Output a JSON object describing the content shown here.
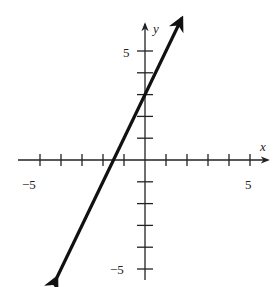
{
  "chart_data": {
    "type": "line",
    "title": "",
    "xlabel": "x",
    "ylabel": "y",
    "xlim": [
      -5.5,
      5.7
    ],
    "ylim": [
      -5.4,
      6.5
    ],
    "x_ticks": [
      -5,
      -4,
      -3,
      -2,
      -1,
      1,
      2,
      3,
      4,
      5
    ],
    "y_ticks": [
      -5,
      -4,
      -3,
      -2,
      -1,
      1,
      2,
      3,
      4,
      5
    ],
    "x_tick_labels": [
      {
        "value": -5,
        "label": "−5"
      },
      {
        "value": 5,
        "label": "5"
      }
    ],
    "y_tick_labels": [
      {
        "value": 5,
        "label": "5"
      },
      {
        "value": -5,
        "label": "−5"
      }
    ],
    "grid": false,
    "series": [
      {
        "name": "y = 2x + 3",
        "equation": "y = 2x + 3",
        "slope": 2,
        "y_intercept": 3,
        "x_intercept": -1.5,
        "x": [
          -4.2,
          1.75
        ],
        "y": [
          -5.4,
          6.5
        ],
        "arrows_both_ends": true
      }
    ]
  },
  "labels": {
    "x_axis": "x",
    "y_axis": "y",
    "x_min": "−5",
    "x_max": "5",
    "y_max": "5",
    "y_min": "−5"
  },
  "colors": {
    "axis": "#222222",
    "line": "#111111",
    "background": "#ffffff"
  }
}
